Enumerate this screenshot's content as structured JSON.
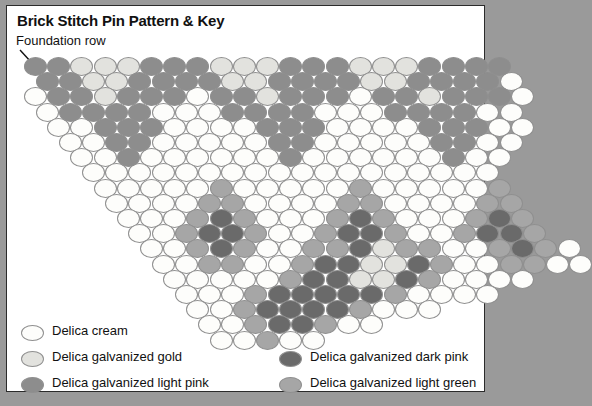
{
  "title": "Brick Stitch Pin Pattern & Key",
  "annotation": {
    "foundation_row_label": "Foundation row"
  },
  "colors": {
    "cream": "#fdfdfb",
    "gold": "#e2e2de",
    "light_pink": "#8d8d8d",
    "dark_pink": "#6a6a6a",
    "light_green": "#a6a6a6",
    "bead_outline": "#8f8f8f",
    "panel_background": "#ffffff",
    "page_background": "#9a9a9a",
    "border": "#2b2b2b",
    "text": "#111111"
  },
  "legend": {
    "items": [
      {
        "label": "Delica cream",
        "key": "cream",
        "column": "left"
      },
      {
        "label": "Delica galvanized gold",
        "key": "gold",
        "column": "left"
      },
      {
        "label": "Delica galvanized light pink",
        "key": "light_pink",
        "column": "left"
      },
      {
        "label": "Delica galvanized dark pink",
        "key": "dark_pink",
        "column": "right"
      },
      {
        "label": "Delica galvanized light green",
        "key": "light_green",
        "column": "right"
      }
    ]
  },
  "chart_data": {
    "type": "heatmap",
    "title": "Brick Stitch Pin Pattern & Key",
    "bead_width": 23,
    "bead_height": 19,
    "step_x": 23.2,
    "step_y": 15.2,
    "origin_x": 17,
    "origin_y": 51,
    "palette_legend": {
      "C": "cream",
      "G": "gold",
      "P": "light_pink",
      "D": "dark_pink",
      "N": "light_green"
    },
    "row_count": 19,
    "rows": [
      {
        "index": 0,
        "offset": 0,
        "cells": "PPGGGPPPGGGPPPGGGPPPP"
      },
      {
        "index": 1,
        "offset": 0.5,
        "cells": "PPGGPPPPGGPPPPGGPPPPC"
      },
      {
        "index": 2,
        "offset": 0,
        "cells": "CPPGPPPCPPGPPPCPPGPPPC"
      },
      {
        "index": 3,
        "offset": 0.5,
        "cells": "CPPPPCCCPPPPCCCPPPPCC"
      },
      {
        "index": 4,
        "offset": 1,
        "cells": "CCPPPCCCCPPPCCCCPPPCC"
      },
      {
        "index": 5,
        "offset": 1.5,
        "cells": "CCPPCCCCCPPCCCCCPPCC"
      },
      {
        "index": 6,
        "offset": 2,
        "cells": "CCPCCCCCCPCCCCCCPCC"
      },
      {
        "index": 7,
        "offset": 2.5,
        "cells": "CCCCCCCCCCCCCCCCCC"
      },
      {
        "index": 8,
        "offset": 3,
        "cells": "CCCCCNCCCCCNCCCCCN"
      },
      {
        "index": 9,
        "offset": 3.5,
        "cells": "CCCCNNCCCCNNCCCCNN"
      },
      {
        "index": 10,
        "offset": 4,
        "cells": "CCCNDNCCCNDNCCCNDN"
      },
      {
        "index": 11,
        "offset": 4.5,
        "cells": "CCNDDNCCNDDNCCNDDN"
      },
      {
        "index": 12,
        "offset": 5,
        "cells": "CCNDNCCNNDGNNCCNDNC"
      },
      {
        "index": 13,
        "offset": 5.5,
        "cells": "CCNNCCNDDGGDNCCNNCC"
      },
      {
        "index": 14,
        "offset": 6,
        "cells": "CCCCCNDDGGDNCCCC"
      },
      {
        "index": 15,
        "offset": 6.5,
        "cells": "CCCNDDDDDNCCCC"
      },
      {
        "index": 16,
        "offset": 7,
        "cells": "CCNDDDDNCCC"
      },
      {
        "index": 17,
        "offset": 7.5,
        "cells": "CCNDDNCC"
      },
      {
        "index": 18,
        "offset": 8,
        "cells": "CCNCC"
      }
    ]
  }
}
